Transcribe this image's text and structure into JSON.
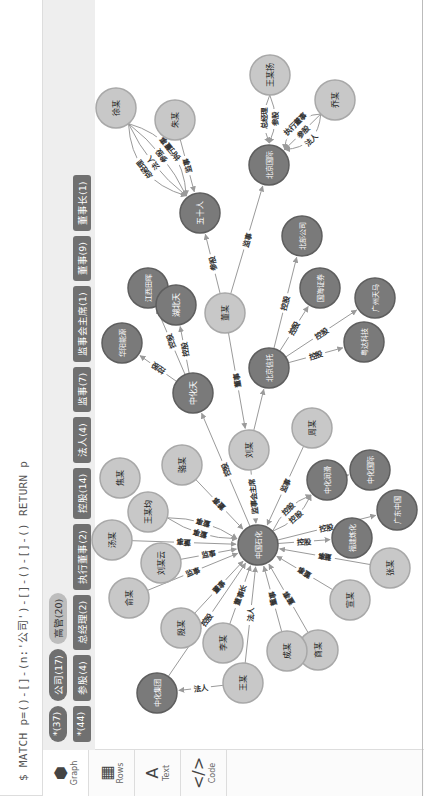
{
  "query": "$ MATCH p=()-[]-(n:'公司')-[]-()-[]-() RETURN p",
  "side_tabs": [
    {
      "label": "Graph",
      "icon": "graph-icon",
      "active": true
    },
    {
      "label": "Rows",
      "icon": "table-icon",
      "active": false
    },
    {
      "label": "Text",
      "icon": "text-icon",
      "active": false
    },
    {
      "label": "Code",
      "icon": "code-icon",
      "active": false
    }
  ],
  "node_labels": [
    {
      "label": "*(37)",
      "style": "dark"
    },
    {
      "label": "公司(17)",
      "style": "dark"
    },
    {
      "label": "高管(20)",
      "style": "light"
    }
  ],
  "rel_types": [
    {
      "label": "*(44)"
    },
    {
      "label": "参股(4)"
    },
    {
      "label": "总经理(2)"
    },
    {
      "label": "执行董事(2)"
    },
    {
      "label": "控股(14)"
    },
    {
      "label": "法人(4)"
    },
    {
      "label": "监事(7)"
    },
    {
      "label": "监事会主席(1)"
    },
    {
      "label": "董事(9)"
    },
    {
      "label": "董事长(1)"
    }
  ],
  "colors": {
    "company": "#7a7a7a",
    "person": "#c8c8c8",
    "edge": "#9a9a9a"
  },
  "graph": {
    "nodes": [
      {
        "id": "zgsh",
        "name": "中国石化",
        "type": "company"
      },
      {
        "id": "wm",
        "name": "王某",
        "type": "person"
      },
      {
        "id": "zhjt",
        "name": "中化集团",
        "type": "company"
      },
      {
        "id": "lm",
        "name": "李某",
        "type": "person"
      },
      {
        "id": "ym",
        "name": "殷某",
        "type": "person"
      },
      {
        "id": "yum",
        "name": "俞某",
        "type": "person"
      },
      {
        "id": "lmy",
        "name": "刘某云",
        "type": "person"
      },
      {
        "id": "tm",
        "name": "汤某",
        "type": "person"
      },
      {
        "id": "wmj",
        "name": "王某均",
        "type": "person"
      },
      {
        "id": "jm",
        "name": "焦某",
        "type": "person"
      },
      {
        "id": "lum",
        "name": "骆某",
        "type": "person"
      },
      {
        "id": "lium",
        "name": "刘某",
        "type": "person"
      },
      {
        "id": "zhm",
        "name": "周某",
        "type": "person"
      },
      {
        "id": "zhrh",
        "name": "中化润滑",
        "type": "company"
      },
      {
        "id": "zhgj",
        "name": "中化国际",
        "type": "company"
      },
      {
        "id": "gdzg",
        "name": "广东中国",
        "type": "company"
      },
      {
        "id": "fjlh",
        "name": "福建炼化",
        "type": "company"
      },
      {
        "id": "zm",
        "name": "张某",
        "type": "person"
      },
      {
        "id": "xm",
        "name": "宣某",
        "type": "person"
      },
      {
        "id": "sm",
        "name": "商某",
        "type": "person"
      },
      {
        "id": "cm",
        "name": "成某",
        "type": "person"
      },
      {
        "id": "zht",
        "name": "中化天",
        "type": "company"
      },
      {
        "id": "hyny",
        "name": "华阳能源",
        "type": "company"
      },
      {
        "id": "jxth",
        "name": "江西田晖",
        "type": "company"
      },
      {
        "id": "hbt",
        "name": "湖北天",
        "type": "company"
      },
      {
        "id": "dm",
        "name": "董某",
        "type": "person"
      },
      {
        "id": "bjxt",
        "name": "北京信托",
        "type": "company"
      },
      {
        "id": "bbgs",
        "name": "北部公司",
        "type": "company"
      },
      {
        "id": "ghzq",
        "name": "国海证券",
        "type": "company"
      },
      {
        "id": "gztm",
        "name": "广州天马",
        "type": "company"
      },
      {
        "id": "ydkj",
        "name": "粤达科技",
        "type": "company"
      },
      {
        "id": "wsr",
        "name": "五十人",
        "type": "company"
      },
      {
        "id": "bjgj",
        "name": "北京国际",
        "type": "company"
      },
      {
        "id": "xum",
        "name": "徐某",
        "type": "person"
      },
      {
        "id": "zum",
        "name": "朱某",
        "type": "person"
      },
      {
        "id": "wmy",
        "name": "王某扬",
        "type": "person"
      },
      {
        "id": "qm",
        "name": "乔某",
        "type": "person"
      }
    ],
    "edges": [
      {
        "from": "wm",
        "to": "zhjt",
        "label": "法人"
      },
      {
        "from": "wm",
        "to": "zgsh",
        "label": "法人"
      },
      {
        "from": "lm",
        "to": "zgsh",
        "label": "董事长"
      },
      {
        "from": "ym",
        "to": "zgsh",
        "label": "董事"
      },
      {
        "from": "zhjt",
        "to": "zgsh",
        "label": "控股"
      },
      {
        "from": "yum",
        "to": "zgsh",
        "label": "监事"
      },
      {
        "from": "lmy",
        "to": "zgsh",
        "label": "监事"
      },
      {
        "from": "tm",
        "to": "zgsh",
        "label": "董事"
      },
      {
        "from": "wmj",
        "to": "zgsh",
        "label": "董事"
      },
      {
        "from": "wmj",
        "to": "zgsh",
        "label": "董事"
      },
      {
        "from": "lum",
        "to": "zgsh",
        "label": "董事"
      },
      {
        "from": "lium",
        "to": "zgsh",
        "label": "监事会主席"
      },
      {
        "from": "zhm",
        "to": "zgsh",
        "label": "监事"
      },
      {
        "from": "zgsh",
        "to": "zht",
        "label": "控股"
      },
      {
        "from": "zgsh",
        "to": "zhrh",
        "label": "控股"
      },
      {
        "from": "zgsh",
        "to": "zhrh",
        "label": "控股"
      },
      {
        "from": "zhrh",
        "to": "zhgj",
        "label": ""
      },
      {
        "from": "zgsh",
        "to": "gdzg",
        "label": "控股"
      },
      {
        "from": "zgsh",
        "to": "fjlh",
        "label": "控股"
      },
      {
        "from": "zm",
        "to": "zgsh",
        "label": "董事"
      },
      {
        "from": "xm",
        "to": "zgsh",
        "label": "董事"
      },
      {
        "from": "sm",
        "to": "zgsh",
        "label": "董事"
      },
      {
        "from": "cm",
        "to": "zgsh",
        "label": "董事"
      },
      {
        "from": "lium",
        "to": "bjxt",
        "label": ""
      },
      {
        "from": "zht",
        "to": "hyny",
        "label": "控股"
      },
      {
        "from": "zht",
        "to": "jxth",
        "label": "控股"
      },
      {
        "from": "zht",
        "to": "hbt",
        "label": "控股"
      },
      {
        "from": "dm",
        "to": "lium",
        "label": "董事"
      },
      {
        "from": "dm",
        "to": "wsr",
        "label": "参股"
      },
      {
        "from": "dm",
        "to": "bjgj",
        "label": "监事"
      },
      {
        "from": "bjxt",
        "to": "bbgs",
        "label": "控股"
      },
      {
        "from": "bjxt",
        "to": "ghzq",
        "label": "控股"
      },
      {
        "from": "bjxt",
        "to": "gztm",
        "label": "控股"
      },
      {
        "from": "bjxt",
        "to": "ydkj",
        "label": "控股"
      },
      {
        "from": "xum",
        "to": "wsr",
        "label": "执行董事"
      },
      {
        "from": "xum",
        "to": "wsr",
        "label": "参股"
      },
      {
        "from": "xum",
        "to": "wsr",
        "label": "法人"
      },
      {
        "from": "xum",
        "to": "wsr",
        "label": "总经理"
      },
      {
        "from": "zum",
        "to": "wsr",
        "label": "监事"
      },
      {
        "from": "wmy",
        "to": "bjgj",
        "label": "参股"
      },
      {
        "from": "wmy",
        "to": "bjgj",
        "label": "总经理"
      },
      {
        "from": "qm",
        "to": "bjgj",
        "label": "法人"
      },
      {
        "from": "qm",
        "to": "bjgj",
        "label": "参股"
      },
      {
        "from": "qm",
        "to": "bjgj",
        "label": "执行董事"
      }
    ]
  }
}
